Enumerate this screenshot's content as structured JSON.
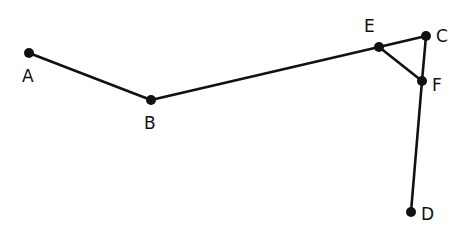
{
  "diagram": {
    "type": "graph",
    "nodes": [
      {
        "id": "A",
        "label": "A",
        "x": 29,
        "y": 53,
        "lx": 22,
        "ly": 82
      },
      {
        "id": "B",
        "label": "B",
        "x": 151,
        "y": 100,
        "lx": 144,
        "ly": 129
      },
      {
        "id": "E",
        "label": "E",
        "x": 379,
        "y": 47,
        "lx": 364,
        "ly": 32
      },
      {
        "id": "C",
        "label": "C",
        "x": 426,
        "y": 36,
        "lx": 436,
        "ly": 42
      },
      {
        "id": "F",
        "label": "F",
        "x": 422,
        "y": 81,
        "lx": 432,
        "ly": 91
      },
      {
        "id": "D",
        "label": "D",
        "x": 411,
        "y": 212,
        "lx": 421,
        "ly": 220
      }
    ],
    "edges": [
      {
        "from": "A",
        "to": "B"
      },
      {
        "from": "B",
        "to": "E"
      },
      {
        "from": "E",
        "to": "C"
      },
      {
        "from": "E",
        "to": "F"
      },
      {
        "from": "C",
        "to": "F"
      },
      {
        "from": "F",
        "to": "D"
      }
    ]
  }
}
